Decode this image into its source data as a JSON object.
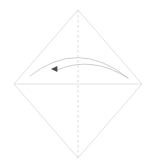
{
  "figure": {
    "kind": "origami-fold-diagram",
    "canvas": {
      "width": 155,
      "height": 168,
      "background": "#ffffff"
    },
    "colors": {
      "paper_edge": "#d9d9d9",
      "fold_line": "#d2d2d2",
      "crease_line": "#dcdcdc",
      "arrow_stroke": "#b9b9b9",
      "arrow_head": "#4a4a4a",
      "background": "#ffffff"
    },
    "shapes": {
      "paper": {
        "name": "square-rotated-45",
        "label": "paper outline",
        "vertices": [
          {
            "label": "top",
            "x": 78,
            "y": 10
          },
          {
            "label": "right",
            "x": 142,
            "y": 84
          },
          {
            "label": "bottom",
            "x": 78,
            "y": 158
          },
          {
            "label": "left",
            "x": 14,
            "y": 84
          }
        ],
        "stroke_width": 0.8
      },
      "vertical_fold": {
        "name": "vertical-dashed-fold-line",
        "label": "valley fold axis",
        "x": 78,
        "y1": 10,
        "y2": 158,
        "style": "dashed",
        "dash_pattern": "2.5 2.5",
        "stroke_width": 0.8
      },
      "horizontal_crease": {
        "name": "horizontal-crease-line",
        "label": "existing horizontal crease",
        "x1": 14,
        "x2": 142,
        "y": 84,
        "style": "solid",
        "stroke_width": 0.8
      },
      "fold_arrow": {
        "name": "curved-fold-arrow",
        "label": "fold direction (right flap folds to the left)",
        "direction": "right-to-left",
        "outer_curve": {
          "start_x": 128,
          "start_y": 78,
          "ctrl_x": 78,
          "ctrl_y": 38,
          "end_x": 30,
          "end_y": 76
        },
        "inner_curve": {
          "start_x": 128,
          "start_y": 78,
          "ctrl_x": 92,
          "ctrl_y": 55,
          "end_x": 57,
          "end_y": 70
        },
        "arrow_head": {
          "x": 55,
          "y": 69,
          "size": 4
        },
        "stroke_width": 0.7
      }
    },
    "annotations": []
  }
}
